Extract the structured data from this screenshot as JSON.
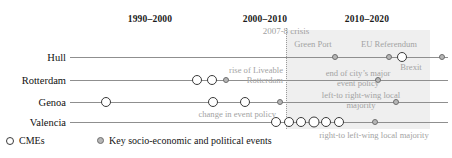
{
  "figure": {
    "width": 452,
    "height": 158,
    "colors": {
      "band": "#e9e9e9",
      "axis": "#8f8f8f",
      "annotation_text": "#a3a3a3",
      "cme_fill": "#ffffff",
      "cme_stroke": "#3a3a3a",
      "event_fill": "#b6b6b6",
      "event_stroke": "#6d6d6d"
    }
  },
  "periods": [
    {
      "label": "1990–2000",
      "x": 150,
      "y": 14
    },
    {
      "label": "2000–2010",
      "x": 265,
      "y": 14
    },
    {
      "label": "2010–2020",
      "x": 367,
      "y": 14
    }
  ],
  "crisis_marker": {
    "label": "2007-8 crisis",
    "x": 286,
    "y": 26
  },
  "rows": [
    {
      "name": "hull",
      "label": "Hull",
      "y": 57
    },
    {
      "name": "rotterdam",
      "label": "Rotterdam",
      "y": 80
    },
    {
      "name": "genoa",
      "label": "Genoa",
      "y": 102
    },
    {
      "name": "valencia",
      "label": "Valencia",
      "y": 122
    }
  ],
  "axis": {
    "x_start": 70,
    "x_end": 448
  },
  "markers": {
    "hull": [
      {
        "type": "event",
        "x": 335,
        "size": 6
      },
      {
        "type": "event",
        "x": 389,
        "size": 6
      },
      {
        "type": "cme",
        "x": 402,
        "size": 10
      },
      {
        "type": "event",
        "x": 442,
        "size": 6
      }
    ],
    "rotterdam": [
      {
        "type": "cme",
        "x": 197,
        "size": 10
      },
      {
        "type": "cme",
        "x": 212,
        "size": 10
      },
      {
        "type": "event",
        "x": 226,
        "size": 6
      },
      {
        "type": "event",
        "x": 378,
        "size": 6
      }
    ],
    "genoa": [
      {
        "type": "cme",
        "x": 106,
        "size": 10
      },
      {
        "type": "cme",
        "x": 213,
        "size": 10
      },
      {
        "type": "cme",
        "x": 245,
        "size": 10
      },
      {
        "type": "event",
        "x": 280,
        "size": 6
      },
      {
        "type": "event",
        "x": 396,
        "size": 6
      }
    ],
    "valencia": [
      {
        "type": "cme",
        "x": 276,
        "size": 10
      },
      {
        "type": "cme",
        "x": 289,
        "size": 10
      },
      {
        "type": "cme",
        "x": 301,
        "size": 10
      },
      {
        "type": "cme",
        "x": 314,
        "size": 11
      },
      {
        "type": "cme",
        "x": 326,
        "size": 10
      },
      {
        "type": "cme",
        "x": 339,
        "size": 10
      },
      {
        "type": "event",
        "x": 375,
        "size": 6
      }
    ]
  },
  "annotations": [
    {
      "name": "green-port",
      "text": "Green Port",
      "x": 313,
      "y": 40,
      "align": "center"
    },
    {
      "name": "eu-referendum",
      "text": "EU Referendum",
      "x": 389,
      "y": 40,
      "align": "center"
    },
    {
      "name": "brexit",
      "text": "Brexit",
      "x": 411,
      "y": 63,
      "align": "center"
    },
    {
      "name": "rise-of-liveable",
      "text": "rise of Liveable",
      "x": 283,
      "y": 66,
      "align": "right"
    },
    {
      "name": "rotterdam-annot",
      "text": "Rotterdam",
      "x": 283,
      "y": 76,
      "align": "right"
    },
    {
      "name": "end-of-city-policy-1",
      "text": "end of city’s major",
      "x": 358,
      "y": 69,
      "align": "center"
    },
    {
      "name": "end-of-city-policy-2",
      "text": "event policy",
      "x": 358,
      "y": 79,
      "align": "center"
    },
    {
      "name": "left-to-right-1",
      "text": "left-to right-wing local",
      "x": 361,
      "y": 91,
      "align": "center"
    },
    {
      "name": "left-to-right-2",
      "text": "majority",
      "x": 361,
      "y": 101,
      "align": "center"
    },
    {
      "name": "change-event-policy",
      "text": "change in event policy",
      "x": 276,
      "y": 110,
      "align": "right"
    },
    {
      "name": "right-to-left",
      "text": "right-to left-wing local majority",
      "x": 374,
      "y": 131,
      "align": "center"
    }
  ],
  "legend": {
    "items": [
      {
        "name": "cme",
        "marker": "cme",
        "label": "CMEs",
        "x": 6
      },
      {
        "name": "event",
        "marker": "event",
        "label": "Key socio-economic and political events",
        "x": 97
      }
    ]
  }
}
